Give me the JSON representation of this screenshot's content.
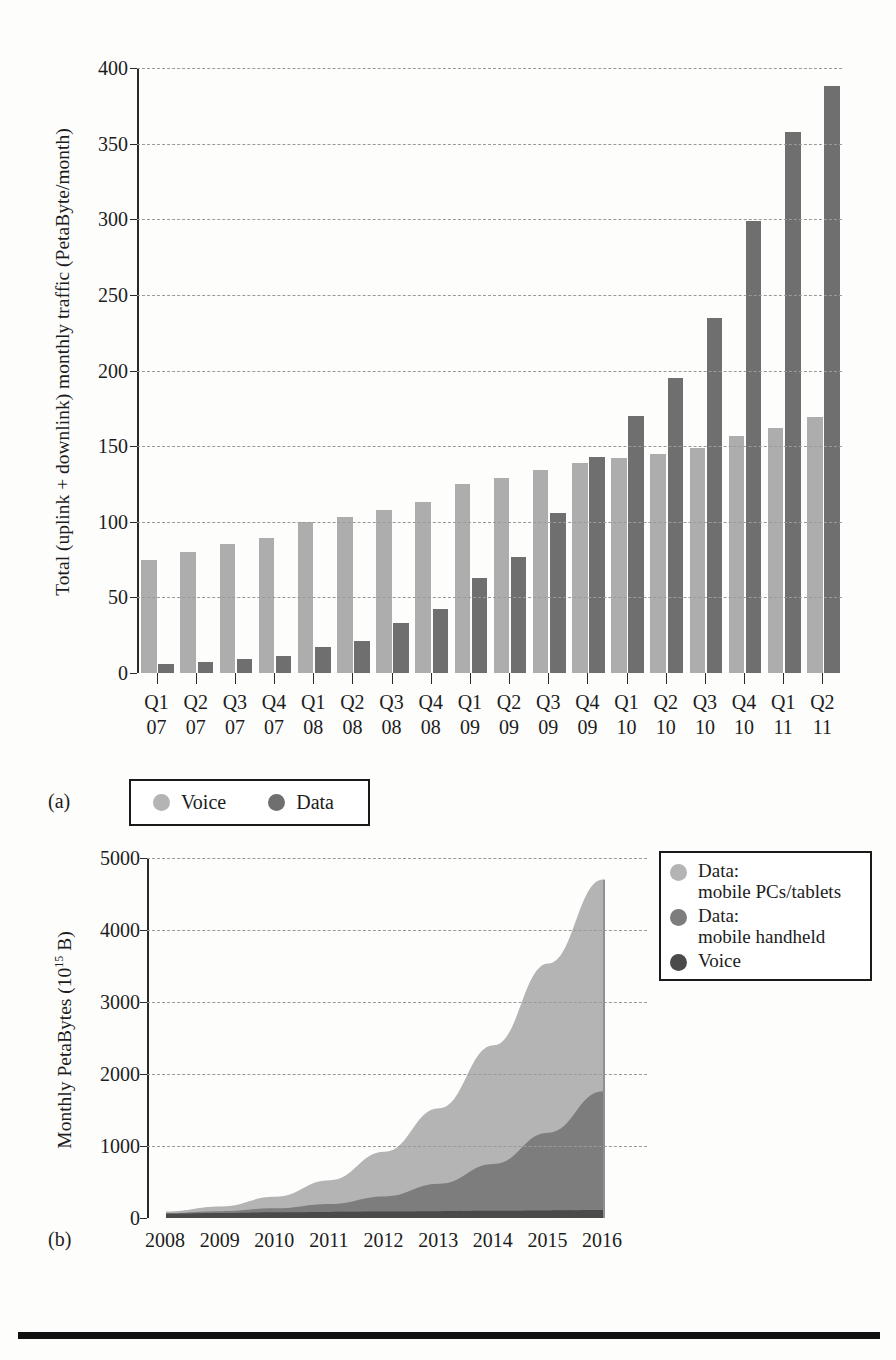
{
  "figure_a": {
    "panel_label": "(a)",
    "ylabel": "Total (uplink + downlink) monthly traffic (PetaByte/month)",
    "yticks": [
      "0",
      "50",
      "100",
      "150",
      "200",
      "250",
      "300",
      "350",
      "400"
    ],
    "legend": [
      {
        "label": "Voice",
        "color": "#b4b4b4",
        "icon": "circle-swatch-icon"
      },
      {
        "label": "Data",
        "color": "#6f6f6f",
        "icon": "circle-swatch-icon"
      }
    ]
  },
  "figure_b": {
    "panel_label": "(b)",
    "ylabel_main": "Monthly PetaBytes (10",
    "ylabel_sup": "15",
    "ylabel_tail": " B)",
    "ylabel_full": "Monthly PetaBytes (10^15 B)",
    "yticks": [
      "0",
      "1000",
      "2000",
      "3000",
      "4000",
      "5000"
    ],
    "legend": [
      {
        "line1": "Data:",
        "line2": "mobile PCs/tablets",
        "color": "#b4b4b4",
        "icon": "circle-swatch-icon"
      },
      {
        "line1": "Data:",
        "line2": "mobile handheld",
        "color": "#7d7d7d",
        "icon": "circle-swatch-icon"
      },
      {
        "line1": "Voice",
        "line2": "",
        "color": "#4a4a4a",
        "icon": "circle-swatch-icon"
      }
    ]
  },
  "chart_data": [
    {
      "type": "bar",
      "title": "",
      "panel": "(a)",
      "xlabel": "",
      "ylabel": "Total (uplink + downlink) monthly traffic (PetaByte/month)",
      "ylim": [
        0,
        400
      ],
      "ytick_step": 50,
      "grid": true,
      "legend_position": "below-left",
      "categories": [
        "Q1 07",
        "Q2 07",
        "Q3 07",
        "Q4 07",
        "Q1 08",
        "Q2 08",
        "Q3 08",
        "Q4 08",
        "Q1 09",
        "Q2 09",
        "Q3 09",
        "Q4 09",
        "Q1 10",
        "Q2 10",
        "Q3 10",
        "Q4 10",
        "Q1 11",
        "Q2 11"
      ],
      "category_lines": [
        [
          "Q1",
          "07"
        ],
        [
          "Q2",
          "07"
        ],
        [
          "Q3",
          "07"
        ],
        [
          "Q4",
          "07"
        ],
        [
          "Q1",
          "08"
        ],
        [
          "Q2",
          "08"
        ],
        [
          "Q3",
          "08"
        ],
        [
          "Q4",
          "08"
        ],
        [
          "Q1",
          "09"
        ],
        [
          "Q2",
          "09"
        ],
        [
          "Q3",
          "09"
        ],
        [
          "Q4",
          "09"
        ],
        [
          "Q1",
          "10"
        ],
        [
          "Q2",
          "10"
        ],
        [
          "Q3",
          "10"
        ],
        [
          "Q4",
          "10"
        ],
        [
          "Q1",
          "11"
        ],
        [
          "Q2",
          "11"
        ]
      ],
      "series": [
        {
          "name": "Voice",
          "color": "#adadad",
          "values": [
            75,
            80,
            85,
            89,
            100,
            103,
            108,
            113,
            125,
            129,
            134,
            139,
            142,
            145,
            149,
            157,
            162,
            169
          ]
        },
        {
          "name": "Data",
          "color": "#6f6f6f",
          "values": [
            6,
            7,
            9,
            11,
            17,
            21,
            33,
            42,
            63,
            77,
            106,
            143,
            170,
            195,
            235,
            299,
            358,
            388
          ]
        }
      ]
    },
    {
      "type": "area",
      "stacked": true,
      "panel": "(b)",
      "xlabel": "",
      "ylabel": "Monthly PetaBytes (10^15 B)",
      "ylim": [
        0,
        5000
      ],
      "ytick_step": 1000,
      "grid": true,
      "legend_position": "top-right",
      "x": [
        2008,
        2009,
        2010,
        2011,
        2012,
        2013,
        2014,
        2015,
        2016
      ],
      "xtick_labels": [
        "2008",
        "2009",
        "2010",
        "2011",
        "2012",
        "2013",
        "2014",
        "2015",
        "2016"
      ],
      "series": [
        {
          "name": "Voice",
          "color": "#4a4a4a",
          "values": [
            60,
            70,
            80,
            85,
            90,
            95,
            100,
            105,
            110
          ]
        },
        {
          "name": "Data: mobile handheld",
          "color": "#7d7d7d",
          "values": [
            10,
            25,
            55,
            110,
            210,
            380,
            650,
            1080,
            1650
          ]
        },
        {
          "name": "Data: mobile PCs/tablets",
          "color": "#b4b4b4",
          "values": [
            20,
            65,
            160,
            330,
            620,
            1050,
            1650,
            2350,
            2940
          ]
        }
      ],
      "cumulative_totals": [
        90,
        160,
        295,
        525,
        920,
        1525,
        2400,
        3535,
        4700
      ]
    }
  ]
}
